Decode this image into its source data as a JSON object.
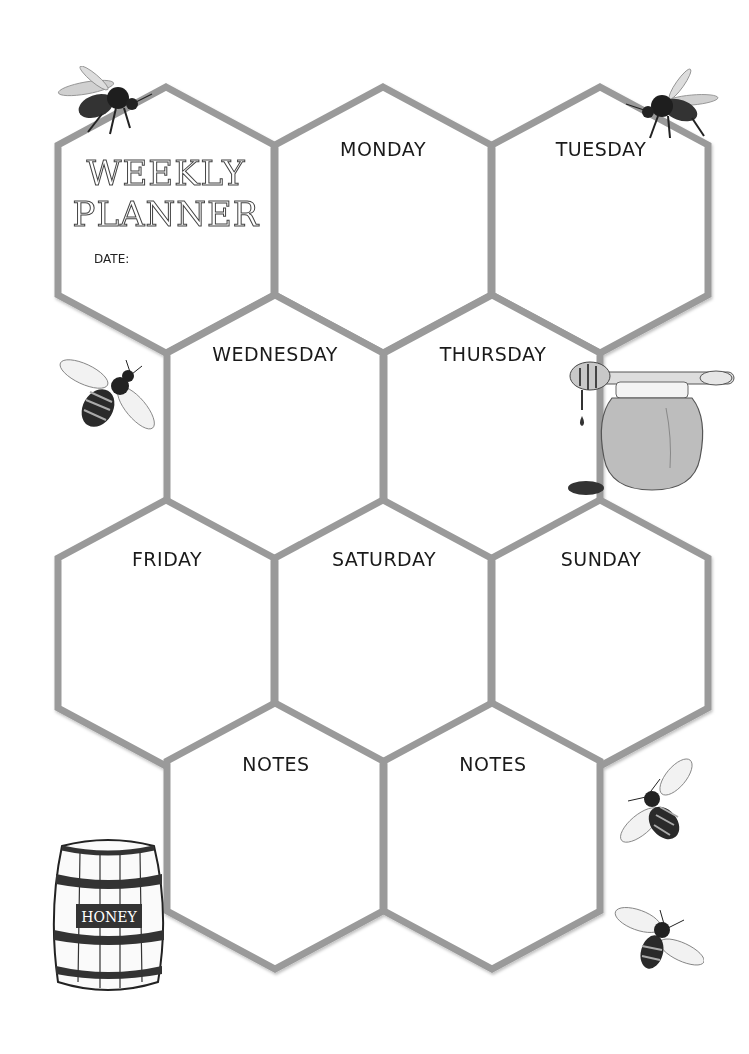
{
  "planner": {
    "title_line1": "WEEKLY",
    "title_line2": "PLANNER",
    "date_label": "DATE:",
    "days": [
      "MONDAY",
      "TUESDAY",
      "WEDNESDAY",
      "THURSDAY",
      "FRIDAY",
      "SATURDAY",
      "SUNDAY"
    ],
    "notes": [
      "NOTES",
      "NOTES"
    ]
  },
  "decorations": {
    "barrel_label": "HONEY"
  },
  "colors": {
    "hex_stroke": "#9a9a9a",
    "text": "#1a1a1a",
    "background": "#ffffff"
  }
}
